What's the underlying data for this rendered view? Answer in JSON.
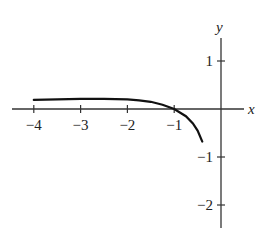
{
  "chart_data": {
    "type": "line",
    "title": "",
    "xlabel": "x",
    "ylabel": "y",
    "xlim": [
      -4.4,
      0.6
    ],
    "ylim": [
      -2.5,
      1.5
    ],
    "grid": false,
    "legend": null,
    "x_ticks": [
      -4,
      -3,
      -2,
      -1
    ],
    "x_tick_labels": [
      "−4",
      "−3",
      "−2",
      "−1"
    ],
    "y_ticks": [
      1,
      -1,
      -2
    ],
    "y_tick_labels": [
      "1",
      "−1",
      "−2"
    ],
    "series": [
      {
        "name": "curve",
        "x": [
          -4,
          -3.5,
          -3,
          -2.5,
          -2,
          -1.75,
          -1.5,
          -1.25,
          -1,
          -0.75,
          -0.6,
          -0.5,
          -0.4
        ],
        "y": [
          0.19,
          0.2,
          0.21,
          0.21,
          0.2,
          0.18,
          0.15,
          0.09,
          0.0,
          -0.15,
          -0.3,
          -0.45,
          -0.68
        ]
      }
    ]
  }
}
